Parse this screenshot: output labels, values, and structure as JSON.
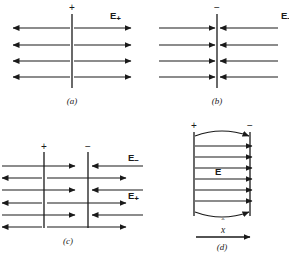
{
  "figure": {
    "type": "physics-diagram",
    "panels": [
      {
        "id": "a",
        "caption": "(a)",
        "plate_signs": [
          "+"
        ],
        "field_label": "E",
        "field_subscript": "+",
        "rows": 4,
        "direction": "outward"
      },
      {
        "id": "b",
        "caption": "(b)",
        "plate_signs": [
          "−"
        ],
        "field_label": "E",
        "field_subscript": "−",
        "rows": 4,
        "direction": "inward"
      },
      {
        "id": "c",
        "caption": "(c)",
        "plate_signs": [
          "+",
          "−"
        ],
        "field_label_minus": "E",
        "field_subscript_minus": "−",
        "field_label_plus": "E",
        "field_subscript_plus": "+",
        "rows": 6,
        "direction": "superposition"
      },
      {
        "id": "d",
        "caption": "(d)",
        "plate_signs": [
          "+",
          "−"
        ],
        "field_label": "E",
        "axis_label": "x",
        "axis_hat": "ˆ",
        "rows": 7,
        "direction": "uniform-right"
      }
    ],
    "colors": {
      "line": "#1a1a1a",
      "background": "#ffffff"
    }
  }
}
